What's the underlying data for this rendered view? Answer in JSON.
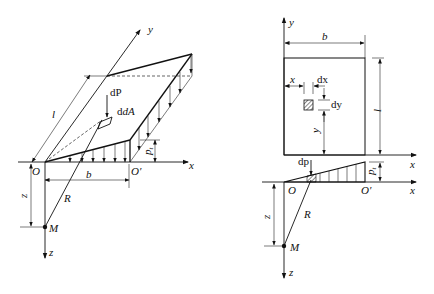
{
  "figure_left": {
    "title": "3D view of triangular distributed load on rectangular area",
    "labels": {
      "y_axis": "y",
      "x_axis": "x",
      "z_axis": "z",
      "origin": "O",
      "corner": "O′",
      "length": "l",
      "width": "b",
      "load_intensity": "p",
      "load_intensity_sub": "t",
      "point_load": "dP",
      "area_element": "dA",
      "radius": "R",
      "depth": "z",
      "point": "M"
    }
  },
  "figure_right": {
    "title": "Plan and elevation view",
    "labels": {
      "y_axis": "y",
      "x_axis_top": "x",
      "x_axis_bottom": "x",
      "z_axis": "z",
      "width": "b",
      "length": "l",
      "x_dist": "x",
      "y_dist": "y",
      "dx": "dx",
      "dy": "dy",
      "point_load": "dp",
      "load_intensity": "p",
      "load_intensity_sub": "t",
      "origin": "O",
      "corner": "O′",
      "radius": "R",
      "depth": "z",
      "point": "M"
    }
  }
}
